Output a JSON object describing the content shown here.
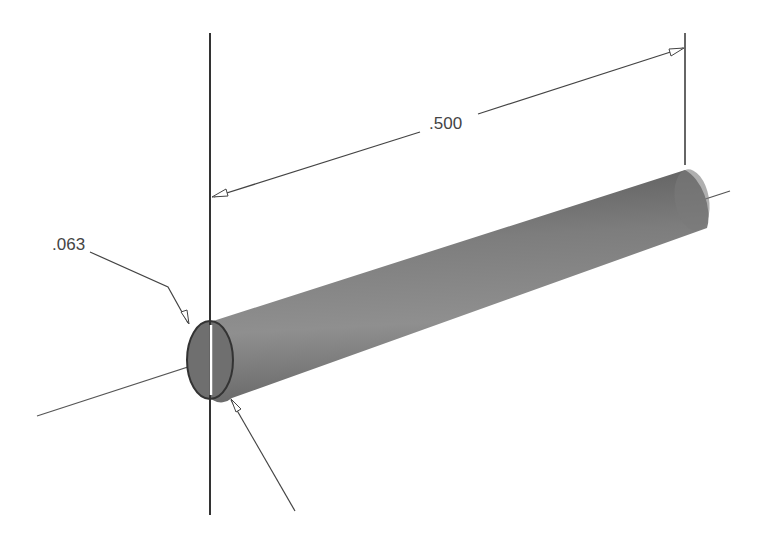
{
  "drawing": {
    "type": "isometric cylinder dimension drawing",
    "dimensions": {
      "length": {
        "label": ".500"
      },
      "diameter": {
        "label": ".063"
      }
    },
    "colors": {
      "background": "#ffffff",
      "line": "#333333",
      "cylinder_light": "#9a9a9a",
      "cylinder_dark": "#5e5e5e",
      "end_face": "#6e6e6e"
    }
  }
}
